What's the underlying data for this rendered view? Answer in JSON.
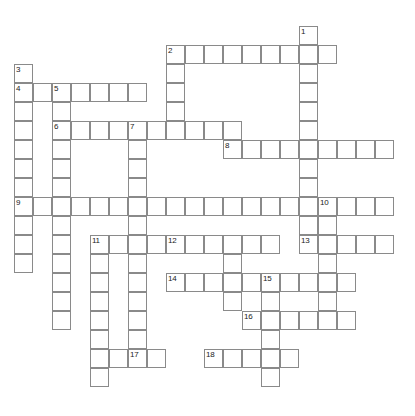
{
  "puzzle": {
    "type": "crossword-grid",
    "title": "Crossword Puzzle Grid",
    "cell_size": 19,
    "origin_x": 14,
    "origin_y": 7,
    "canvas": {
      "width": 415,
      "height": 416
    },
    "colors": {
      "background": "#ffffff",
      "cell_fill": "#ffffff",
      "cell_border": "#8a8a8a",
      "number_text": "#1a1a1a"
    },
    "entries": [
      {
        "number": "1",
        "direction": "down",
        "col": 15,
        "row": 1,
        "length": 14
      },
      {
        "number": "2",
        "direction": "across",
        "col": 8,
        "row": 2,
        "length": 9
      },
      {
        "number": "2",
        "direction": "down",
        "col": 8,
        "row": 2,
        "length": 6
      },
      {
        "number": "3",
        "direction": "down",
        "col": 0,
        "row": 3,
        "length": 14
      },
      {
        "number": "4",
        "direction": "across",
        "col": 0,
        "row": 4,
        "length": 7
      },
      {
        "number": "5",
        "direction": "down",
        "col": 2,
        "row": 4,
        "length": 10
      },
      {
        "number": "6",
        "direction": "across",
        "col": 2,
        "row": 6,
        "length": 10
      },
      {
        "number": "7",
        "direction": "down",
        "col": 6,
        "row": 6,
        "length": 13
      },
      {
        "number": "8",
        "direction": "across",
        "col": 11,
        "row": 7,
        "length": 9
      },
      {
        "number": "9",
        "direction": "across",
        "col": 0,
        "row": 10,
        "length": 20
      },
      {
        "number": "10",
        "direction": "down",
        "col": 16,
        "row": 10,
        "length": 7
      },
      {
        "number": "11",
        "direction": "across",
        "col": 4,
        "row": 12,
        "length": 10
      },
      {
        "number": "11",
        "direction": "down",
        "col": 4,
        "row": 12,
        "length": 8
      },
      {
        "number": "12",
        "direction": "across",
        "col": 8,
        "row": 12,
        "length": 6
      },
      {
        "number": "12",
        "direction": "down",
        "col": 11,
        "row": 12,
        "length": 4
      },
      {
        "number": "13",
        "direction": "across",
        "col": 15,
        "row": 12,
        "length": 5
      },
      {
        "number": "14",
        "direction": "across",
        "col": 8,
        "row": 14,
        "length": 10
      },
      {
        "number": "15",
        "direction": "down",
        "col": 13,
        "row": 14,
        "length": 6
      },
      {
        "number": "16",
        "direction": "across",
        "col": 12,
        "row": 16,
        "length": 6
      },
      {
        "number": "17",
        "direction": "across",
        "col": 6,
        "row": 18,
        "length": 3
      },
      {
        "number": "18",
        "direction": "across",
        "col": 10,
        "row": 18,
        "length": 5
      }
    ],
    "cells": [
      {
        "col": 15,
        "row": 1
      },
      {
        "col": 8,
        "row": 2
      },
      {
        "col": 9,
        "row": 2
      },
      {
        "col": 10,
        "row": 2
      },
      {
        "col": 11,
        "row": 2
      },
      {
        "col": 12,
        "row": 2
      },
      {
        "col": 13,
        "row": 2
      },
      {
        "col": 14,
        "row": 2
      },
      {
        "col": 15,
        "row": 2
      },
      {
        "col": 16,
        "row": 2
      },
      {
        "col": 0,
        "row": 3
      },
      {
        "col": 8,
        "row": 3
      },
      {
        "col": 15,
        "row": 3
      },
      {
        "col": 0,
        "row": 4
      },
      {
        "col": 1,
        "row": 4
      },
      {
        "col": 2,
        "row": 4
      },
      {
        "col": 3,
        "row": 4
      },
      {
        "col": 4,
        "row": 4
      },
      {
        "col": 5,
        "row": 4
      },
      {
        "col": 6,
        "row": 4
      },
      {
        "col": 8,
        "row": 4
      },
      {
        "col": 15,
        "row": 4
      },
      {
        "col": 0,
        "row": 5
      },
      {
        "col": 2,
        "row": 5
      },
      {
        "col": 8,
        "row": 5
      },
      {
        "col": 15,
        "row": 5
      },
      {
        "col": 0,
        "row": 6
      },
      {
        "col": 2,
        "row": 6
      },
      {
        "col": 3,
        "row": 6
      },
      {
        "col": 4,
        "row": 6
      },
      {
        "col": 5,
        "row": 6
      },
      {
        "col": 6,
        "row": 6
      },
      {
        "col": 7,
        "row": 6
      },
      {
        "col": 8,
        "row": 6
      },
      {
        "col": 9,
        "row": 6
      },
      {
        "col": 10,
        "row": 6
      },
      {
        "col": 11,
        "row": 6
      },
      {
        "col": 15,
        "row": 6
      },
      {
        "col": 0,
        "row": 7
      },
      {
        "col": 2,
        "row": 7
      },
      {
        "col": 6,
        "row": 7
      },
      {
        "col": 11,
        "row": 7
      },
      {
        "col": 12,
        "row": 7
      },
      {
        "col": 13,
        "row": 7
      },
      {
        "col": 14,
        "row": 7
      },
      {
        "col": 15,
        "row": 7
      },
      {
        "col": 16,
        "row": 7
      },
      {
        "col": 17,
        "row": 7
      },
      {
        "col": 18,
        "row": 7
      },
      {
        "col": 19,
        "row": 7
      },
      {
        "col": 0,
        "row": 8
      },
      {
        "col": 2,
        "row": 8
      },
      {
        "col": 6,
        "row": 8
      },
      {
        "col": 15,
        "row": 8
      },
      {
        "col": 0,
        "row": 9
      },
      {
        "col": 2,
        "row": 9
      },
      {
        "col": 6,
        "row": 9
      },
      {
        "col": 15,
        "row": 9
      },
      {
        "col": 0,
        "row": 10
      },
      {
        "col": 1,
        "row": 10
      },
      {
        "col": 2,
        "row": 10
      },
      {
        "col": 3,
        "row": 10
      },
      {
        "col": 4,
        "row": 10
      },
      {
        "col": 5,
        "row": 10
      },
      {
        "col": 6,
        "row": 10
      },
      {
        "col": 7,
        "row": 10
      },
      {
        "col": 8,
        "row": 10
      },
      {
        "col": 9,
        "row": 10
      },
      {
        "col": 10,
        "row": 10
      },
      {
        "col": 11,
        "row": 10
      },
      {
        "col": 12,
        "row": 10
      },
      {
        "col": 13,
        "row": 10
      },
      {
        "col": 14,
        "row": 10
      },
      {
        "col": 15,
        "row": 10
      },
      {
        "col": 16,
        "row": 10
      },
      {
        "col": 17,
        "row": 10
      },
      {
        "col": 18,
        "row": 10
      },
      {
        "col": 19,
        "row": 10
      },
      {
        "col": 0,
        "row": 11
      },
      {
        "col": 2,
        "row": 11
      },
      {
        "col": 6,
        "row": 11
      },
      {
        "col": 15,
        "row": 11
      },
      {
        "col": 16,
        "row": 11
      },
      {
        "col": 0,
        "row": 12
      },
      {
        "col": 2,
        "row": 12
      },
      {
        "col": 4,
        "row": 12
      },
      {
        "col": 5,
        "row": 12
      },
      {
        "col": 6,
        "row": 12
      },
      {
        "col": 7,
        "row": 12
      },
      {
        "col": 8,
        "row": 12
      },
      {
        "col": 9,
        "row": 12
      },
      {
        "col": 10,
        "row": 12
      },
      {
        "col": 11,
        "row": 12
      },
      {
        "col": 12,
        "row": 12
      },
      {
        "col": 13,
        "row": 12
      },
      {
        "col": 15,
        "row": 12
      },
      {
        "col": 16,
        "row": 12
      },
      {
        "col": 17,
        "row": 12
      },
      {
        "col": 18,
        "row": 12
      },
      {
        "col": 19,
        "row": 12
      },
      {
        "col": 0,
        "row": 13
      },
      {
        "col": 2,
        "row": 13
      },
      {
        "col": 4,
        "row": 13
      },
      {
        "col": 6,
        "row": 13
      },
      {
        "col": 11,
        "row": 13
      },
      {
        "col": 16,
        "row": 13
      },
      {
        "col": 2,
        "row": 14
      },
      {
        "col": 4,
        "row": 14
      },
      {
        "col": 6,
        "row": 14
      },
      {
        "col": 8,
        "row": 14
      },
      {
        "col": 9,
        "row": 14
      },
      {
        "col": 10,
        "row": 14
      },
      {
        "col": 11,
        "row": 14
      },
      {
        "col": 12,
        "row": 14
      },
      {
        "col": 13,
        "row": 14
      },
      {
        "col": 14,
        "row": 14
      },
      {
        "col": 15,
        "row": 14
      },
      {
        "col": 16,
        "row": 14
      },
      {
        "col": 17,
        "row": 14
      },
      {
        "col": 2,
        "row": 15
      },
      {
        "col": 4,
        "row": 15
      },
      {
        "col": 6,
        "row": 15
      },
      {
        "col": 11,
        "row": 15
      },
      {
        "col": 13,
        "row": 15
      },
      {
        "col": 16,
        "row": 15
      },
      {
        "col": 2,
        "row": 16
      },
      {
        "col": 4,
        "row": 16
      },
      {
        "col": 6,
        "row": 16
      },
      {
        "col": 12,
        "row": 16
      },
      {
        "col": 13,
        "row": 16
      },
      {
        "col": 14,
        "row": 16
      },
      {
        "col": 15,
        "row": 16
      },
      {
        "col": 16,
        "row": 16
      },
      {
        "col": 17,
        "row": 16
      },
      {
        "col": 4,
        "row": 17
      },
      {
        "col": 6,
        "row": 17
      },
      {
        "col": 13,
        "row": 17
      },
      {
        "col": 4,
        "row": 18
      },
      {
        "col": 5,
        "row": 18
      },
      {
        "col": 6,
        "row": 18
      },
      {
        "col": 7,
        "row": 18
      },
      {
        "col": 10,
        "row": 18
      },
      {
        "col": 11,
        "row": 18
      },
      {
        "col": 12,
        "row": 18
      },
      {
        "col": 13,
        "row": 18
      },
      {
        "col": 14,
        "row": 18
      },
      {
        "col": 4,
        "row": 19
      },
      {
        "col": 13,
        "row": 19
      }
    ],
    "numbers": [
      {
        "label": "1",
        "col": 15,
        "row": 1
      },
      {
        "label": "2",
        "col": 8,
        "row": 2
      },
      {
        "label": "3",
        "col": 0,
        "row": 3
      },
      {
        "label": "4",
        "col": 0,
        "row": 4
      },
      {
        "label": "5",
        "col": 2,
        "row": 4
      },
      {
        "label": "6",
        "col": 2,
        "row": 6
      },
      {
        "label": "7",
        "col": 6,
        "row": 6
      },
      {
        "label": "8",
        "col": 11,
        "row": 7
      },
      {
        "label": "9",
        "col": 0,
        "row": 10
      },
      {
        "label": "10",
        "col": 16,
        "row": 10
      },
      {
        "label": "11",
        "col": 4,
        "row": 12
      },
      {
        "label": "12",
        "col": 8,
        "row": 12
      },
      {
        "label": "13",
        "col": 15,
        "row": 12
      },
      {
        "label": "14",
        "col": 8,
        "row": 14
      },
      {
        "label": "15",
        "col": 13,
        "row": 14
      },
      {
        "label": "16",
        "col": 12,
        "row": 16
      },
      {
        "label": "17",
        "col": 6,
        "row": 18
      },
      {
        "label": "18",
        "col": 10,
        "row": 18
      }
    ]
  }
}
